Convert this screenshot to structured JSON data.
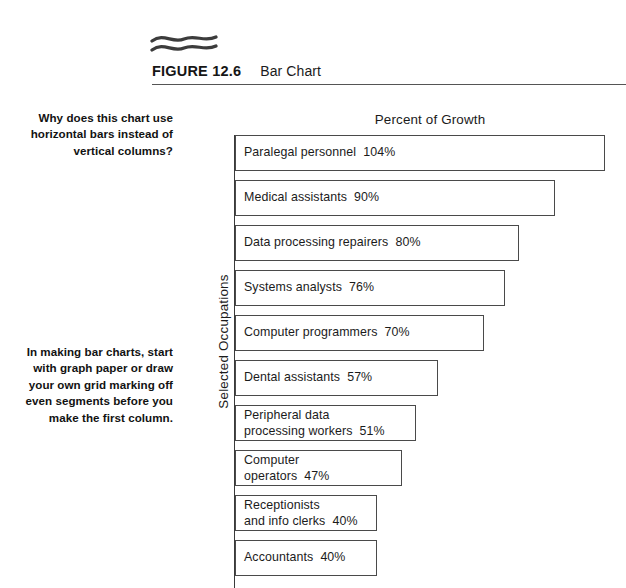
{
  "figure": {
    "ornament": "double-wave-ornament",
    "number": "FIGURE 12.6",
    "title": "Bar Chart"
  },
  "margin_notes": [
    {
      "id": "note-1",
      "text": "Why does this chart use horizontal bars instead of vertical columns?"
    },
    {
      "id": "note-2",
      "text": "In making bar charts, start with graph paper or draw your own grid marking off even segments before you make the first column."
    }
  ],
  "chart_data": {
    "type": "bar",
    "orientation": "horizontal",
    "title": "Percent of Growth",
    "xlabel": "Percent of Growth",
    "ylabel": "Selected Occupations",
    "grid": false,
    "legend": false,
    "xlim": [
      0,
      110
    ],
    "categories": [
      "Paralegal personnel",
      "Medical assistants",
      "Data processing repairers",
      "Systems analysts",
      "Computer programmers",
      "Dental assistants",
      "Peripheral data processing workers",
      "Computer operators",
      "Receptionists and info clerks",
      "Accountants"
    ],
    "values": [
      104,
      90,
      80,
      76,
      70,
      57,
      51,
      47,
      40,
      40
    ],
    "bar_labels": [
      "Paralegal personnel  104%",
      "Medical assistants  90%",
      "Data processing repairers  80%",
      "Systems analysts  76%",
      "Computer programmers  70%",
      "Dental assistants  57%",
      "Peripheral data\nprocessing workers  51%",
      "Computer\noperators  47%",
      "Receptionists\nand info clerks  40%",
      "Accountants  40%"
    ],
    "bar_border_color": "#4a4a4a",
    "bar_fill_color": "#ffffff"
  }
}
